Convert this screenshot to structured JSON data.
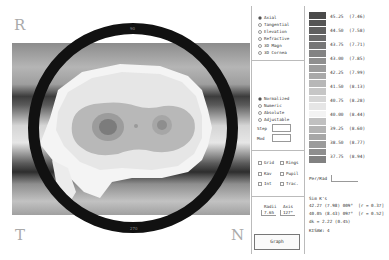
{
  "view": {
    "orientation_left_top": "R",
    "orientation_left_bottom": "T",
    "orientation_right_bottom": "N",
    "ring_labels": [
      "0",
      "30",
      "60",
      "90",
      "120",
      "150",
      "180",
      "210",
      "240",
      "270",
      "300",
      "330"
    ]
  },
  "map_type": {
    "options": [
      {
        "label": "Axial",
        "selected": true
      },
      {
        "label": "Tangential",
        "selected": false
      },
      {
        "label": "Elevation",
        "selected": false
      },
      {
        "label": "Refractive",
        "selected": false
      },
      {
        "label": "3D Magn",
        "selected": false
      },
      {
        "label": "3D Cornea",
        "selected": false
      }
    ]
  },
  "scale_type": {
    "options": [
      {
        "label": "Normalized",
        "selected": true
      },
      {
        "label": "Numeric",
        "selected": false
      },
      {
        "label": "Absolute",
        "selected": false
      },
      {
        "label": "Adjustable",
        "selected": false
      }
    ],
    "step_label": "Step",
    "step_value": "",
    "mod_label": "Mod",
    "mod_value": ""
  },
  "overlays": {
    "items": [
      {
        "label": "Grid",
        "checked": false
      },
      {
        "label": "Rings",
        "checked": false
      },
      {
        "label": "Kav",
        "checked": false
      },
      {
        "label": "Pupil",
        "checked": false
      },
      {
        "label": "Int",
        "checked": false
      },
      {
        "label": "Trac.",
        "checked": false
      }
    ]
  },
  "cursor": {
    "radii_label": "Radii",
    "radii_value": "7.65",
    "axis_label": "Axis",
    "axis_value": "127°"
  },
  "graph_button": "Graph",
  "color_scale": {
    "colors": [
      "#4a4a4a",
      "#555555",
      "#606060",
      "#6b6b6b",
      "#777777",
      "#838383",
      "#8f8f8f",
      "#9c9c9c",
      "#a9a9a9",
      "#b7b7b7",
      "#c6c6c6",
      "#d6d6d6",
      "#e6e6e6",
      "#f3f3f3",
      "#c0c0c0",
      "#b3b3b3",
      "#a7a7a7",
      "#9b9b9b",
      "#8e8e8e",
      "#818181",
      "#737373",
      "#666666",
      "#585858",
      "#4b4b4b",
      "#3f3f3f",
      "#343434",
      "#2b2b2b",
      "#222222",
      "#3a3a3a",
      "#5a5a5a"
    ],
    "ticks": [
      {
        "d": "45.25",
        "mm": "(7.46)"
      },
      {
        "d": "44.50",
        "mm": "(7.58)"
      },
      {
        "d": "43.75",
        "mm": "(7.71)"
      },
      {
        "d": "43.00",
        "mm": "(7.85)"
      },
      {
        "d": "42.25",
        "mm": "(7.99)"
      },
      {
        "d": "41.50",
        "mm": "(8.13)"
      },
      {
        "d": "40.75",
        "mm": "(8.28)"
      },
      {
        "d": "40.00",
        "mm": "(8.44)"
      },
      {
        "d": "39.25",
        "mm": "(8.60)"
      },
      {
        "d": "38.50",
        "mm": "(8.77)"
      },
      {
        "d": "37.75",
        "mm": "(8.94)"
      }
    ]
  },
  "per_rad_label": "Per/Rad",
  "sim_k": {
    "title": "Sim K's",
    "k1": "42.27 (7.98) 009°",
    "k1_r": "[r = 0.37]",
    "k2": "40.05 (8.43) 097°",
    "k2_r": "[r = 0.52]",
    "dk": "dk = 2.22 (0.45)",
    "kisa": "KISAW: 4"
  }
}
